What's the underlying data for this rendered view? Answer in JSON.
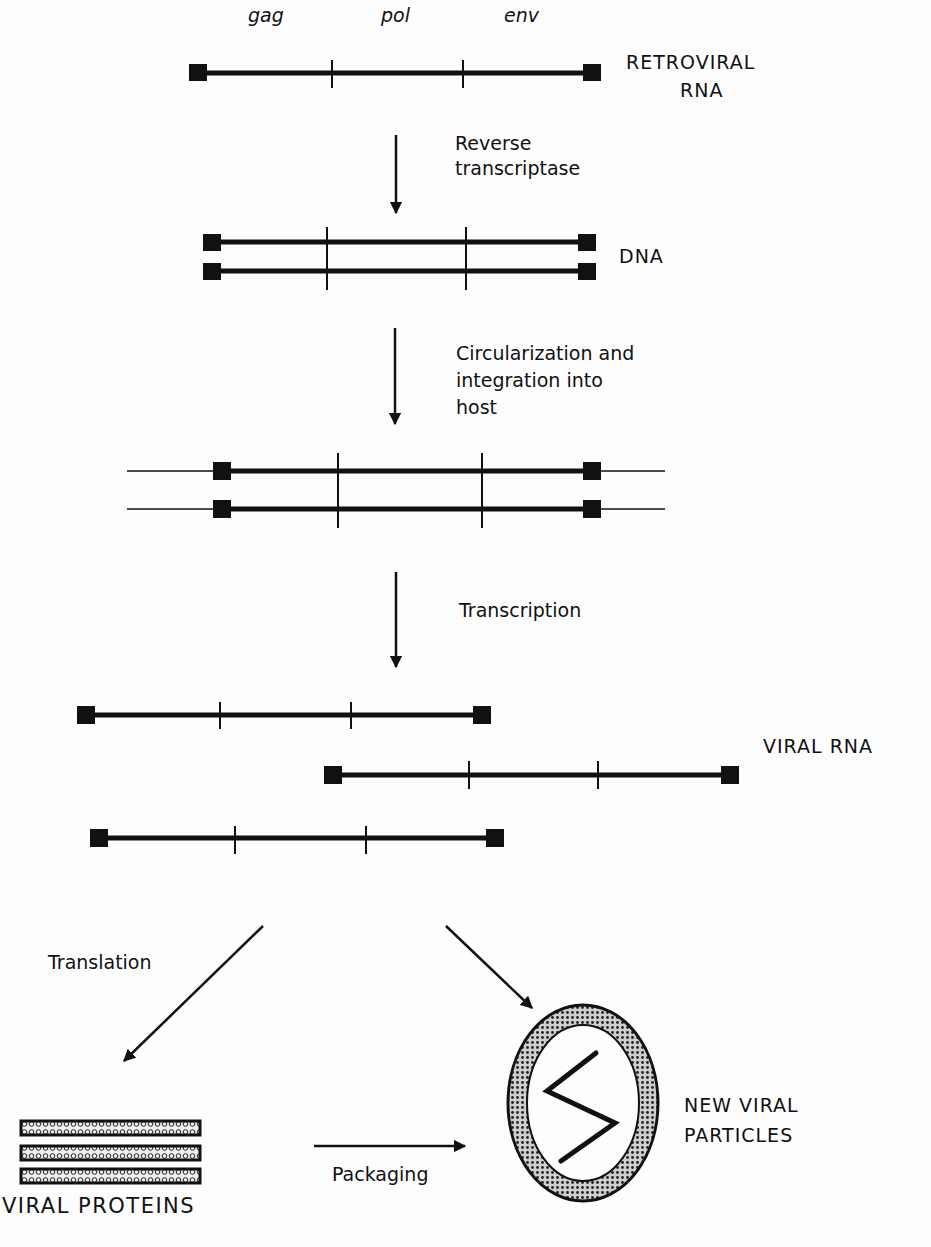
{
  "genes": {
    "gag": "gag",
    "pol": "pol",
    "env": "env"
  },
  "labels": {
    "retroviral_rna_1": "RETROVIRAL",
    "retroviral_rna_2": "RNA",
    "dna": "DNA",
    "viral_rna": "VIRAL RNA",
    "viral_proteins": "VIRAL PROTEINS",
    "new_viral_1": "NEW VIRAL",
    "new_viral_2": "PARTICLES"
  },
  "steps": {
    "reverse_1": "Reverse",
    "reverse_2": "transcriptase",
    "circ_1": "Circularization and",
    "circ_2": "integration into",
    "circ_3": "host",
    "transcription": "Transcription",
    "translation": "Translation",
    "packaging": "Packaging"
  },
  "colors": {
    "ink": "#111111",
    "background": "#fdfdfd"
  }
}
